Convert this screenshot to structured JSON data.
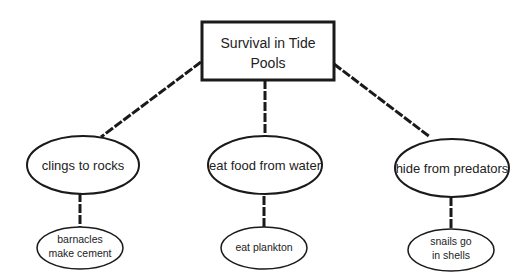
{
  "diagram": {
    "root": {
      "line1": "Survival in Tide",
      "line2": "Pools"
    },
    "branches": [
      {
        "label": "clings to rocks",
        "child": {
          "line1": "barnacles",
          "line2": "make cement"
        }
      },
      {
        "label": "eat food from water",
        "child": {
          "line1": "eat plankton",
          "line2": ""
        }
      },
      {
        "label": "hide from predators",
        "child": {
          "line1": "snails go",
          "line2": "in shells"
        }
      }
    ]
  },
  "colors": {
    "stroke": "#1a1a1a",
    "background": "#ffffff",
    "text": "#222222"
  }
}
